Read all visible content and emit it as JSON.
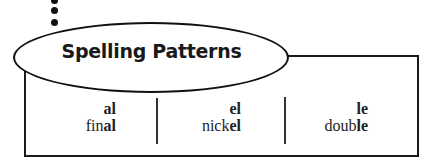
{
  "title": "Spelling Patterns",
  "colors": {
    "ink": "#1a1a1a",
    "background": "#ffffff"
  },
  "bullets": [
    "dot",
    "dot",
    "dot"
  ],
  "patterns": [
    {
      "pattern": "al",
      "example_prefix": "fin",
      "example_suffix": "al",
      "example": "final"
    },
    {
      "pattern": "el",
      "example_prefix": "nick",
      "example_suffix": "el",
      "example": "nickel"
    },
    {
      "pattern": "le",
      "example_prefix": "doub",
      "example_suffix": "le",
      "example": "double"
    }
  ]
}
